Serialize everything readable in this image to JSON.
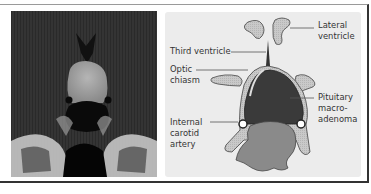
{
  "figure": {
    "left_panel": {
      "type": "coronal MRI scan"
    },
    "right_panel": {
      "type": "schematic diagram",
      "labels": {
        "lateral_ventricle": "Lateral\nventricle",
        "third_ventricle": "Third ventricle",
        "optic_chiasm": "Optic\nchiasm",
        "pituitary_macroadenoma": "Pituitary\nmacro-\nadenoma",
        "internal_carotid_artery": "Internal\ncarotid\nartery"
      }
    },
    "colors": {
      "tumor": "#3a3a3a",
      "ventricle_fill": "#c8c8c8",
      "sphenoid": "#8a8a8a",
      "background": "#ececec"
    }
  }
}
